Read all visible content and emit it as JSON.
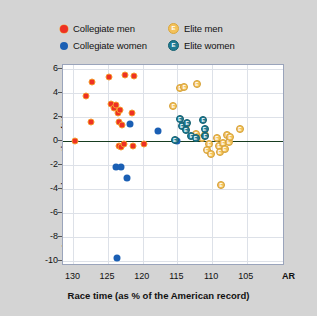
{
  "chart_data": {
    "type": "scatter",
    "title": "",
    "xlabel": "Race time (as % of the American record)",
    "ylabel": "Improvement in race time (%)",
    "xlim": [
      131.5,
      99.5
    ],
    "ylim": [
      -10.4,
      6.3
    ],
    "x_ticks": [
      130,
      125,
      120,
      115,
      110,
      105
    ],
    "x_tick_labels": [
      "130",
      "125",
      "120",
      "115",
      "110",
      "105"
    ],
    "x_extra_tick": {
      "value": 100,
      "label": "AR"
    },
    "y_ticks": [
      6,
      4,
      2,
      0,
      -2,
      -4,
      -6,
      -8,
      -10
    ],
    "y_tick_labels": [
      "6",
      "4",
      "2",
      "0",
      "-2",
      "-4",
      "-6",
      "-8",
      "-10"
    ],
    "grid": true,
    "legend_position": "top",
    "reference_line": {
      "y": 0,
      "color": "#173d20"
    },
    "series": [
      {
        "name": "Collegiate men",
        "marker": "circle",
        "color": "#ee3124",
        "edge_color": "#f59a2e",
        "points": [
          [
            129.8,
            0.0
          ],
          [
            127.3,
            4.9
          ],
          [
            128.2,
            3.7
          ],
          [
            127.4,
            1.6
          ],
          [
            124.8,
            5.3
          ],
          [
            124.6,
            3.1
          ],
          [
            124.2,
            2.7
          ],
          [
            123.9,
            3.0
          ],
          [
            123.6,
            2.3
          ],
          [
            123.5,
            1.6
          ],
          [
            123.3,
            2.6
          ],
          [
            123.0,
            1.3
          ],
          [
            122.6,
            5.5
          ],
          [
            121.3,
            5.4
          ],
          [
            121.5,
            2.3
          ],
          [
            123.4,
            -0.4
          ],
          [
            123.1,
            -0.5
          ],
          [
            122.7,
            -0.3
          ],
          [
            121.4,
            -0.4
          ],
          [
            119.8,
            -0.3
          ]
        ]
      },
      {
        "name": "Collegiate women",
        "marker": "circle",
        "color": "#1a5fb4",
        "points": [
          [
            121.9,
            1.4
          ],
          [
            117.8,
            0.8
          ],
          [
            115.1,
            0.0
          ],
          [
            123.9,
            -2.2
          ],
          [
            123.1,
            -2.2
          ],
          [
            122.3,
            -3.1
          ],
          [
            123.7,
            -9.7
          ]
        ]
      },
      {
        "name": "Elite men",
        "marker": "circle-E",
        "color": "#f3c15a",
        "points": [
          [
            114.6,
            4.4
          ],
          [
            114.0,
            4.5
          ],
          [
            112.2,
            4.7
          ],
          [
            115.6,
            2.9
          ],
          [
            113.8,
            1.3
          ],
          [
            112.3,
            0.6
          ],
          [
            111.4,
            0.2
          ],
          [
            111.0,
            0.5
          ],
          [
            110.4,
            -0.3
          ],
          [
            110.8,
            -0.8
          ],
          [
            110.2,
            -1.1
          ],
          [
            109.3,
            0.2
          ],
          [
            109.0,
            -0.4
          ],
          [
            108.9,
            -0.9
          ],
          [
            108.4,
            -0.2
          ],
          [
            108.2,
            -0.7
          ],
          [
            107.8,
            0.5
          ],
          [
            107.6,
            -0.1
          ],
          [
            107.4,
            0.3
          ],
          [
            106.0,
            1.0
          ],
          [
            108.7,
            -3.7
          ]
        ]
      },
      {
        "name": "Elite women",
        "marker": "circle-E",
        "color": "#1f7b93",
        "points": [
          [
            114.7,
            1.8
          ],
          [
            114.4,
            1.2
          ],
          [
            113.8,
            0.9
          ],
          [
            113.6,
            1.5
          ],
          [
            113.0,
            0.4
          ],
          [
            112.4,
            0.2
          ],
          [
            115.4,
            0.1
          ],
          [
            111.3,
            1.7
          ],
          [
            111.1,
            1.0
          ],
          [
            111.0,
            0.4
          ]
        ]
      }
    ]
  },
  "legend": {
    "entries": [
      {
        "label": "Collegiate men",
        "marker": "dot-red",
        "color": "#ee3124"
      },
      {
        "label": "Elite men",
        "marker": "badge-E-gold",
        "color": "#f3c15a",
        "glyph": "E"
      },
      {
        "label": "Collegiate women",
        "marker": "dot-blue",
        "color": "#1a5fb4"
      },
      {
        "label": "Elite women",
        "marker": "badge-E-teal",
        "color": "#1f7b93",
        "glyph": "E"
      }
    ]
  }
}
